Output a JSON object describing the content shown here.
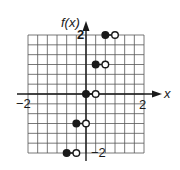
{
  "chart_data": {
    "type": "scatter",
    "subtype": "step-function",
    "title": "",
    "xlabel": "x",
    "ylabel": "f(x)",
    "xlim": [
      -2,
      2
    ],
    "ylim": [
      -2,
      2
    ],
    "grid": true,
    "grid_step": 0.3333,
    "x_tick_labels": [
      {
        "value": -2,
        "label": "−2"
      },
      {
        "value": 2,
        "label": "2"
      }
    ],
    "y_tick_labels": [
      {
        "value": 2,
        "label": "2"
      },
      {
        "value": -2,
        "label": "−2"
      }
    ],
    "segments": [
      {
        "x_start": -0.6667,
        "x_end": -0.3333,
        "y": -2,
        "start_closed": true,
        "end_closed": false
      },
      {
        "x_start": -0.3333,
        "x_end": 0,
        "y": -1,
        "start_closed": true,
        "end_closed": false
      },
      {
        "x_start": 0,
        "x_end": 0.3333,
        "y": 0,
        "start_closed": true,
        "end_closed": false
      },
      {
        "x_start": 0.3333,
        "x_end": 0.6667,
        "y": 1,
        "start_closed": true,
        "end_closed": false
      },
      {
        "x_start": 0.6667,
        "x_end": 1,
        "y": 2,
        "start_closed": true,
        "end_closed": false
      }
    ]
  },
  "labels": {
    "y_axis": "f(x)",
    "x_axis": "x",
    "x_min": "−2",
    "x_max": "2",
    "y_max": "2",
    "y_min": "−2"
  },
  "colors": {
    "ink": "#1a1a1a",
    "grid": "#555555",
    "background": "#ffffff"
  }
}
